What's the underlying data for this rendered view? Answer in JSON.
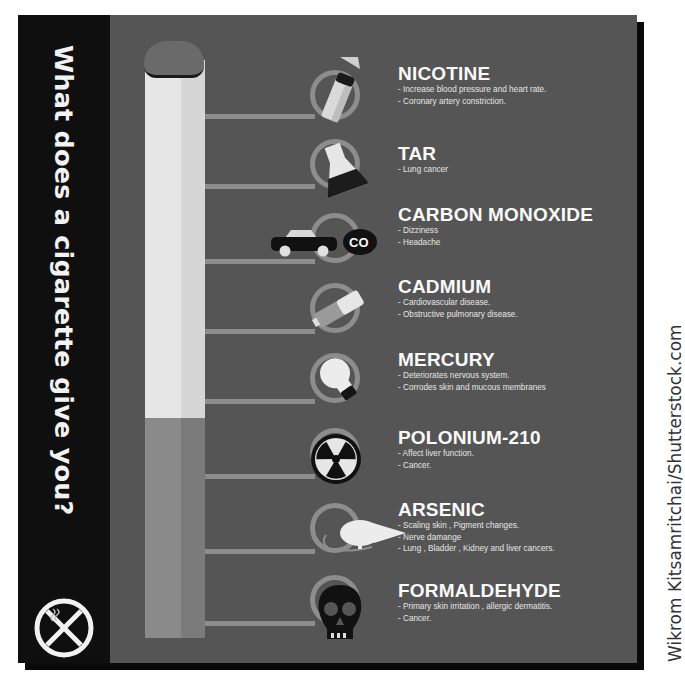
{
  "title": "What does a cigarette give you?",
  "credit": "Wikrom Kitsamritchai/Shutterstock.com",
  "colors": {
    "panel": "#555555",
    "sidebar": "#0f0f0f",
    "connector": "#8d8d8d",
    "text": "#fafafa"
  },
  "substances": [
    {
      "name": "NICOTINE",
      "icon": "cigarette-pack-spray-icon",
      "effects": [
        "- Increase blood pressure and heart rate.",
        "- Coronary artery constriction."
      ]
    },
    {
      "name": "TAR",
      "icon": "flask-icon",
      "effects": [
        "- Lung cancer"
      ]
    },
    {
      "name": "CARBON MONOXIDE",
      "icon": "car-exhaust-co-icon",
      "icon_label": "CO",
      "effects": [
        "- Dizziness",
        "- Headache"
      ]
    },
    {
      "name": "CADMIUM",
      "icon": "battery-icon",
      "effects": [
        "- Cardiovascular disease.",
        "- Obstructive pulmonary disease."
      ]
    },
    {
      "name": "MERCURY",
      "icon": "light-bulb-icon",
      "effects": [
        "- Deteriorates nervous system.",
        "- Corrodes skin and mucous membranes"
      ]
    },
    {
      "name": "POLONIUM-210",
      "icon": "radiation-icon",
      "effects": [
        "- Affect liver function.",
        "- Cancer."
      ]
    },
    {
      "name": "ARSENIC",
      "icon": "rat-icon",
      "effects": [
        "- Scaling skin , Pigment changes.",
        "- Nerve damange",
        "- Lung , Bladder , Kidney and liver cancers."
      ]
    },
    {
      "name": "FORMALDEHYDE",
      "icon": "skull-icon",
      "effects": [
        "- Primary skin irritation , allergic dermatitis.",
        "- Cancer."
      ]
    }
  ]
}
